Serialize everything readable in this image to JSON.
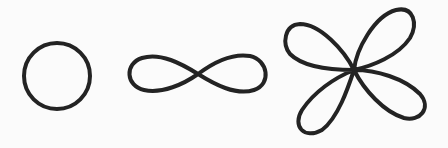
{
  "figure": {
    "background": "#fbfbfb",
    "stroke_color": "#232323",
    "stroke_width": 4,
    "shapes": [
      {
        "name": "circle",
        "cx": 57,
        "cy": 76,
        "r": 33
      },
      {
        "name": "lemniscate",
        "cx": 198,
        "cy": 74,
        "a": 68
      },
      {
        "name": "four-leaf-rose",
        "cx": 354,
        "cy": 70
      }
    ]
  }
}
